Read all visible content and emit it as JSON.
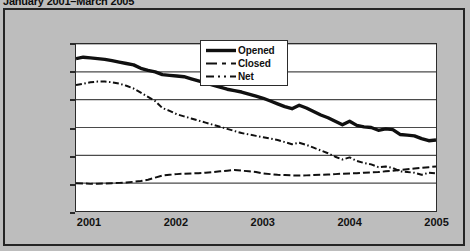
{
  "title": "January 2001–March 2005",
  "colors": {
    "background": "#bdbdbd",
    "plot_background": "#ffffff",
    "axis": "#2b2b2b",
    "gridline": "#4a4a4a",
    "series": "#101010",
    "frame": "#252525"
  },
  "legend": {
    "position": "inside-top-center",
    "items": [
      {
        "label": "Opened",
        "style": "solid-thick"
      },
      {
        "label": "Closed",
        "style": "dashed"
      },
      {
        "label": "Net",
        "style": "dash-dot"
      }
    ]
  },
  "chart_data": {
    "type": "line",
    "title": "January 2001–March 2005",
    "xlabel": "",
    "ylabel": "",
    "ylim": [
      0,
      12000
    ],
    "ytick_labels": [
      "0",
      "2,000",
      "4,000",
      "6,000",
      "8,000",
      "10,000",
      "12,000"
    ],
    "ytick_values": [
      0,
      2000,
      4000,
      6000,
      8000,
      10000,
      12000
    ],
    "xtick_labels": [
      "2001",
      "2002",
      "2003",
      "2004",
      "2005"
    ],
    "xtick_values": [
      0,
      12,
      24,
      36,
      48
    ],
    "grid": true,
    "grid_axis": "y",
    "x": [
      0,
      1,
      2,
      3,
      4,
      5,
      6,
      7,
      8,
      9,
      10,
      11,
      12,
      13,
      14,
      15,
      16,
      17,
      18,
      19,
      20,
      21,
      22,
      23,
      24,
      25,
      26,
      27,
      28,
      29,
      30,
      31,
      32,
      33,
      34,
      35,
      36,
      37,
      38,
      39,
      40,
      41,
      42,
      43,
      44,
      45,
      46,
      47,
      48,
      49,
      50
    ],
    "series": [
      {
        "name": "Opened",
        "style": "solid-thick",
        "values": [
          10950,
          11050,
          11000,
          10950,
          10900,
          10800,
          10700,
          10600,
          10500,
          10250,
          10100,
          10000,
          9800,
          9750,
          9700,
          9650,
          9500,
          9350,
          9200,
          9050,
          8900,
          8750,
          8650,
          8550,
          8400,
          8250,
          8100,
          7900,
          7700,
          7500,
          7350,
          7600,
          7400,
          7150,
          6900,
          6700,
          6450,
          6200,
          6450,
          6150,
          6050,
          6000,
          5800,
          5900,
          5850,
          5500,
          5450,
          5400,
          5200,
          5050,
          5100
        ]
      },
      {
        "name": "Closed",
        "style": "dashed",
        "values": [
          2000,
          1980,
          1950,
          1960,
          1980,
          2000,
          2020,
          2050,
          2100,
          2150,
          2250,
          2400,
          2550,
          2600,
          2650,
          2680,
          2700,
          2720,
          2750,
          2800,
          2850,
          2900,
          2950,
          2900,
          2850,
          2800,
          2700,
          2650,
          2600,
          2580,
          2560,
          2550,
          2560,
          2580,
          2600,
          2620,
          2650,
          2680,
          2700,
          2720,
          2750,
          2780,
          2800,
          2850,
          2900,
          2950,
          3000,
          3050,
          3100,
          3150,
          3200
        ]
      },
      {
        "name": "Net",
        "style": "dash-dot",
        "values": [
          9050,
          9150,
          9250,
          9300,
          9300,
          9250,
          9150,
          9000,
          8800,
          8500,
          8200,
          7900,
          7400,
          7200,
          6950,
          6800,
          6650,
          6500,
          6350,
          6200,
          6050,
          5900,
          5750,
          5600,
          5500,
          5400,
          5300,
          5200,
          5100,
          4950,
          4800,
          4900,
          4750,
          4550,
          4350,
          4150,
          3900,
          3700,
          3850,
          3600,
          3450,
          3350,
          3150,
          3200,
          3100,
          2850,
          2800,
          2750,
          2600,
          2750,
          2700
        ]
      }
    ]
  }
}
